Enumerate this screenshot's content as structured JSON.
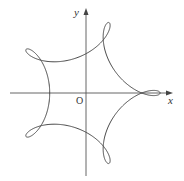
{
  "figure": {
    "type": "parametric-curve",
    "axes": {
      "x_label": "x",
      "y_label": "y",
      "origin_label": "O",
      "origin_px": [
        86,
        93
      ],
      "x_range_px": [
        10,
        172
      ],
      "y_range_px": [
        8,
        176
      ]
    },
    "curve": {
      "family": "hypotrochoid",
      "R": 5,
      "r": 1,
      "d": 1.37,
      "scale_px": 13.8,
      "loops": 5,
      "stroke": "#4a4a4a"
    },
    "colors": {
      "axis": "#555555",
      "curve": "#4a4a4a",
      "background": "#ffffff"
    }
  }
}
